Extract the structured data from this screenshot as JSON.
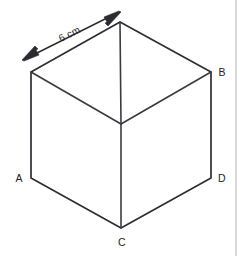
{
  "figure": {
    "kind": "isometric-cube",
    "background_color": "#ffffff",
    "stroke_color": "#2e2e33",
    "dimension": {
      "label": "6 cm",
      "value": 6,
      "unit": "cm",
      "arrow_style": "double-headed",
      "measures_edge": "top-left edge"
    },
    "vertex_labels": [
      {
        "id": "A",
        "text": "A",
        "position": "left"
      },
      {
        "id": "B",
        "text": "B",
        "position": "upper-right"
      },
      {
        "id": "C",
        "text": "C",
        "position": "bottom"
      },
      {
        "id": "D",
        "text": "D",
        "position": "lower-right"
      }
    ],
    "geometry": {
      "hexagon_points": "120,22 211,72 211,178 121,228 31,178 31,72",
      "center": {
        "x": 121,
        "y": 124
      },
      "inner_edges": [
        {
          "from": "top",
          "path": "M120,22 L121,124"
        },
        {
          "from": "left",
          "path": "M31,72 L121,124"
        },
        {
          "from": "right",
          "path": "M211,72 L121,124"
        },
        {
          "from": "bottom",
          "path": "M121,124 L121,228"
        }
      ],
      "dimension_line": {
        "x1": 27,
        "y1": 58,
        "x2": 115,
        "y2": 14
      },
      "arrowhead_start": "27,58 38,52 35,48",
      "arrowhead_end": "116,13 104,18 107,23"
    }
  },
  "page_edge": {
    "visible": true,
    "color": "#b9b9bd",
    "x": 236
  }
}
